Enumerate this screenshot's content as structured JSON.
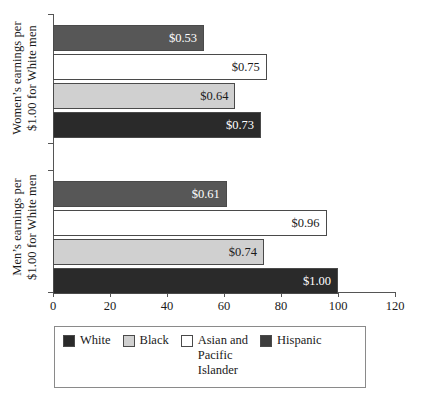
{
  "chart_data": {
    "type": "bar",
    "orientation": "horizontal",
    "title": "",
    "xlabel": "",
    "xlim": [
      0,
      120
    ],
    "xticks": [
      0,
      20,
      40,
      60,
      80,
      100,
      120
    ],
    "grid": false,
    "legend_position": "bottom",
    "groups": [
      {
        "name": "Women's earnings per $1.00 for White men",
        "ylabel_lines": [
          "Women’s earnings per",
          "$1.00 for White men"
        ],
        "bars": [
          {
            "series": "Hispanic",
            "value": 53,
            "label": "$0.53",
            "color": "#575757",
            "label_color": "light"
          },
          {
            "series": "Asian and Pacific Islander",
            "value": 75,
            "label": "$0.75",
            "color": "#ffffff",
            "label_color": "dark"
          },
          {
            "series": "Black",
            "value": 64,
            "label": "$0.64",
            "color": "#d0d0d0",
            "label_color": "dark"
          },
          {
            "series": "White",
            "value": 73,
            "label": "$0.73",
            "color": "#2a2a2a",
            "label_color": "light"
          }
        ]
      },
      {
        "name": "Men's earnings per $1.00 for White men",
        "ylabel_lines": [
          "Men’s earnings per",
          "$1.00 for White men"
        ],
        "bars": [
          {
            "series": "Hispanic",
            "value": 61,
            "label": "$0.61",
            "color": "#575757",
            "label_color": "light"
          },
          {
            "series": "Asian and Pacific Islander",
            "value": 96,
            "label": "$0.96",
            "color": "#ffffff",
            "label_color": "dark"
          },
          {
            "series": "Black",
            "value": 74,
            "label": "$0.74",
            "color": "#d0d0d0",
            "label_color": "dark"
          },
          {
            "series": "White",
            "value": 100,
            "label": "$1.00",
            "color": "#2a2a2a",
            "label_color": "light"
          }
        ]
      }
    ],
    "legend": [
      {
        "label": "White",
        "color": "#2a2a2a"
      },
      {
        "label": "Black",
        "color": "#d0d0d0"
      },
      {
        "label": "Asian and\nPacific\nIslander",
        "color": "#ffffff"
      },
      {
        "label": "Hispanic",
        "color": "#3d3d3d"
      }
    ]
  },
  "axis": {
    "tick_labels": [
      "0",
      "20",
      "40",
      "60",
      "80",
      "100",
      "120"
    ]
  },
  "ylabels": {
    "women_line1": "Women’s earnings per",
    "women_line2": "$1.00 for White men",
    "men_line1": "Men’s earnings per",
    "men_line2": "$1.00 for White men"
  },
  "values": {
    "women_hispanic": "$0.53",
    "women_asian": "$0.75",
    "women_black": "$0.64",
    "women_white": "$0.73",
    "men_hispanic": "$0.61",
    "men_asian": "$0.96",
    "men_black": "$0.74",
    "men_white": "$1.00"
  },
  "legend_labels": {
    "white": "White",
    "black": "Black",
    "asian": "Asian and\nPacific\nIslander",
    "hispanic": "Hispanic"
  }
}
